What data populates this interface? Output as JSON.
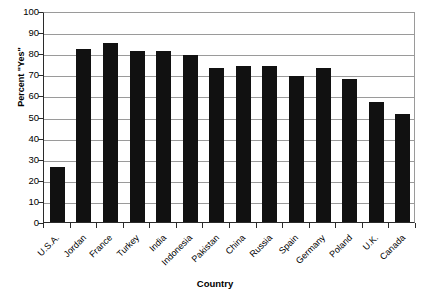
{
  "chart_data": {
    "type": "bar",
    "title": "",
    "xlabel": "Country",
    "ylabel": "Percent \"Yes\"",
    "ylim": [
      0,
      100
    ],
    "ytick_step": 10,
    "yticks": [
      100,
      90,
      80,
      70,
      60,
      50,
      40,
      30,
      20,
      10,
      0
    ],
    "grid": true,
    "legend": null,
    "bar_color": "#111111",
    "gridline_color": "#9a9a9a",
    "axis_color": "#2b2b2b",
    "categories": [
      "U.S.A.",
      "Jordan",
      "France",
      "Turkey",
      "India",
      "Indonesia",
      "Pakistan",
      "China",
      "Russia",
      "Spain",
      "Germany",
      "Poland",
      "U.K.",
      "Canada"
    ],
    "values": [
      26,
      82,
      85,
      81,
      81,
      79,
      73,
      74,
      74,
      69,
      73,
      68,
      57,
      51
    ]
  }
}
